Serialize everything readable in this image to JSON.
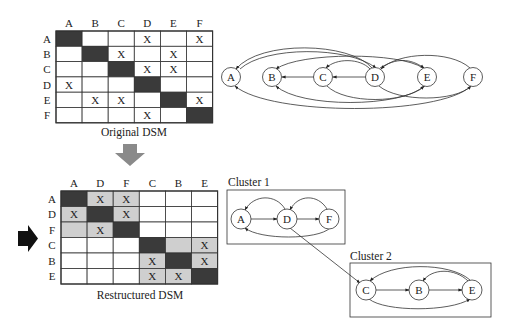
{
  "original_dsm": {
    "caption": "Original DSM",
    "columns": [
      "A",
      "B",
      "C",
      "D",
      "E",
      "F"
    ],
    "rows": [
      "A",
      "B",
      "C",
      "D",
      "E",
      "F"
    ],
    "marks": [
      [
        "",
        "",
        "",
        "X",
        "",
        "X"
      ],
      [
        "",
        "",
        "X",
        "",
        "X",
        ""
      ],
      [
        "",
        "",
        "",
        "X",
        "X",
        ""
      ],
      [
        "X",
        "",
        "",
        "",
        "",
        ""
      ],
      [
        "",
        "X",
        "X",
        "",
        "",
        "X"
      ],
      [
        "",
        "",
        "",
        "X",
        "",
        ""
      ]
    ]
  },
  "restructured_dsm": {
    "caption": "Restructured DSM",
    "columns": [
      "A",
      "D",
      "F",
      "C",
      "B",
      "E"
    ],
    "rows": [
      "A",
      "D",
      "F",
      "C",
      "B",
      "E"
    ],
    "marks": [
      [
        "",
        "X",
        "X",
        "",
        "",
        ""
      ],
      [
        "X",
        "",
        "X",
        "",
        "",
        ""
      ],
      [
        "",
        "X",
        "",
        "",
        "",
        ""
      ],
      [
        "",
        "",
        "",
        "",
        "",
        "X"
      ],
      [
        "",
        "",
        "",
        "X",
        "",
        "X"
      ],
      [
        "",
        "",
        "",
        "X",
        "X",
        ""
      ]
    ],
    "clusters": [
      [
        0,
        2
      ],
      [
        3,
        5
      ]
    ]
  },
  "original_graph": {
    "nodes": [
      "A",
      "B",
      "C",
      "D",
      "E",
      "F"
    ]
  },
  "cluster1": {
    "label": "Cluster 1",
    "nodes": [
      "A",
      "D",
      "F"
    ]
  },
  "cluster2": {
    "label": "Cluster 2",
    "nodes": [
      "C",
      "B",
      "E"
    ]
  },
  "colors": {
    "diagonal": "#3a3a3a",
    "cluster_fill": "#cfcfcf",
    "grid": "#333333",
    "down_arrow": "#8a8a8a",
    "side_arrow": "#111111"
  }
}
